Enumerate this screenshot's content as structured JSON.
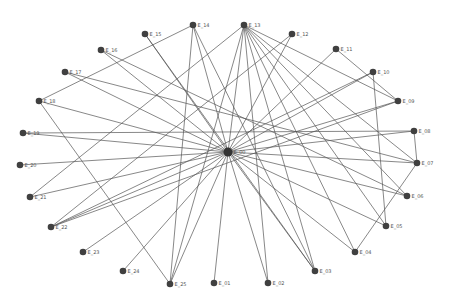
{
  "graph": {
    "title": "",
    "hub": {
      "id": "E_00",
      "x": 228,
      "y": 152
    },
    "nodes": [
      {
        "id": "E_01",
        "x": 214,
        "y": 283
      },
      {
        "id": "E_02",
        "x": 268,
        "y": 283
      },
      {
        "id": "E_03",
        "x": 315,
        "y": 271
      },
      {
        "id": "E_04",
        "x": 355,
        "y": 252
      },
      {
        "id": "E_05",
        "x": 386,
        "y": 226
      },
      {
        "id": "E_06",
        "x": 407,
        "y": 196
      },
      {
        "id": "E_07",
        "x": 417,
        "y": 163
      },
      {
        "id": "E_08",
        "x": 414,
        "y": 131
      },
      {
        "id": "E_09",
        "x": 398,
        "y": 101
      },
      {
        "id": "E_10",
        "x": 373,
        "y": 72
      },
      {
        "id": "E_11",
        "x": 336,
        "y": 49
      },
      {
        "id": "E_12",
        "x": 292,
        "y": 34
      },
      {
        "id": "E_13",
        "x": 244,
        "y": 25
      },
      {
        "id": "E_14",
        "x": 193,
        "y": 25
      },
      {
        "id": "E_15",
        "x": 145,
        "y": 34
      },
      {
        "id": "E_16",
        "x": 101,
        "y": 50
      },
      {
        "id": "E_17",
        "x": 65,
        "y": 72
      },
      {
        "id": "E_18",
        "x": 39,
        "y": 101
      },
      {
        "id": "E_19",
        "x": 23,
        "y": 133
      },
      {
        "id": "E_20",
        "x": 20,
        "y": 165
      },
      {
        "id": "E_21",
        "x": 30,
        "y": 197
      },
      {
        "id": "E_22",
        "x": 51,
        "y": 227
      },
      {
        "id": "E_23",
        "x": 83,
        "y": 252
      },
      {
        "id": "E_24",
        "x": 123,
        "y": 271
      },
      {
        "id": "E_25",
        "x": 170,
        "y": 284
      }
    ],
    "edges": [
      [
        "E_00",
        "E_01"
      ],
      [
        "E_00",
        "E_02"
      ],
      [
        "E_00",
        "E_03"
      ],
      [
        "E_00",
        "E_04"
      ],
      [
        "E_00",
        "E_05"
      ],
      [
        "E_00",
        "E_06"
      ],
      [
        "E_00",
        "E_07"
      ],
      [
        "E_00",
        "E_08"
      ],
      [
        "E_00",
        "E_09"
      ],
      [
        "E_00",
        "E_10"
      ],
      [
        "E_00",
        "E_11"
      ],
      [
        "E_00",
        "E_12"
      ],
      [
        "E_00",
        "E_13"
      ],
      [
        "E_00",
        "E_14"
      ],
      [
        "E_00",
        "E_15"
      ],
      [
        "E_00",
        "E_16"
      ],
      [
        "E_00",
        "E_17"
      ],
      [
        "E_00",
        "E_18"
      ],
      [
        "E_00",
        "E_19"
      ],
      [
        "E_00",
        "E_20"
      ],
      [
        "E_00",
        "E_21"
      ],
      [
        "E_00",
        "E_22"
      ],
      [
        "E_00",
        "E_23"
      ],
      [
        "E_00",
        "E_24"
      ],
      [
        "E_00",
        "E_25"
      ],
      [
        "E_13",
        "E_09"
      ],
      [
        "E_13",
        "E_06"
      ],
      [
        "E_13",
        "E_05"
      ],
      [
        "E_13",
        "E_04"
      ],
      [
        "E_13",
        "E_03"
      ],
      [
        "E_13",
        "E_02"
      ],
      [
        "E_13",
        "E_25"
      ],
      [
        "E_13",
        "E_21"
      ],
      [
        "E_13",
        "E_07"
      ],
      [
        "E_14",
        "E_18"
      ],
      [
        "E_14",
        "E_25"
      ],
      [
        "E_14",
        "E_03"
      ],
      [
        "E_15",
        "E_03"
      ],
      [
        "E_17",
        "E_07"
      ],
      [
        "E_18",
        "E_25"
      ],
      [
        "E_19",
        "E_08"
      ],
      [
        "E_12",
        "E_22"
      ],
      [
        "E_11",
        "E_09"
      ],
      [
        "E_10",
        "E_22"
      ],
      [
        "E_10",
        "E_05"
      ],
      [
        "E_08",
        "E_07"
      ],
      [
        "E_07",
        "E_04"
      ],
      [
        "E_09",
        "E_22"
      ],
      [
        "E_16",
        "E_06"
      ]
    ]
  }
}
